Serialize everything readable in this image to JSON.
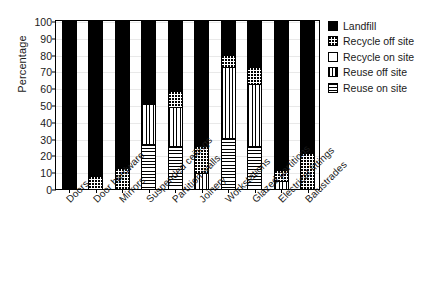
{
  "chart_data": {
    "type": "bar",
    "title": "",
    "subtitle": "",
    "xlabel": "",
    "ylabel": "Percentage",
    "ylim": [
      0,
      100
    ],
    "yticks": [
      0,
      10,
      20,
      30,
      40,
      50,
      60,
      70,
      80,
      90,
      100
    ],
    "grid": true,
    "stacked": true,
    "legend_position": "right",
    "categories": [
      "Doors",
      "Door hardware",
      "Mirrors",
      "Suspended ceilings",
      "Partition walls",
      "Joinery",
      "Workstations",
      "Glazed partitions",
      "Electrical fittings",
      "Balustrades"
    ],
    "series": [
      {
        "name": "Reuse on site",
        "pattern": "horizontal-lines",
        "color": "#ffffff",
        "values": [
          0,
          0,
          0,
          26,
          25,
          0,
          30,
          25,
          0,
          0
        ]
      },
      {
        "name": "Reuse off site",
        "pattern": "vertical-lines",
        "color": "#ffffff",
        "values": [
          0,
          0,
          0,
          24,
          23,
          9,
          42,
          37,
          4,
          0
        ]
      },
      {
        "name": "Recycle on site",
        "pattern": "solid-white",
        "color": "#ffffff",
        "values": [
          0,
          0,
          0,
          0,
          0,
          0,
          0,
          0,
          0,
          0
        ]
      },
      {
        "name": "Recycle off site",
        "pattern": "dots",
        "color": "#ffffff",
        "values": [
          0,
          7,
          12,
          0,
          10,
          16,
          7,
          10,
          7,
          21
        ]
      },
      {
        "name": "Landfill",
        "pattern": "solid-black",
        "color": "#000000",
        "values": [
          100,
          93,
          88,
          50,
          42,
          75,
          21,
          28,
          89,
          79
        ]
      }
    ]
  },
  "legend": {
    "items": [
      {
        "label": "Landfill",
        "swatch": "sw-landfill"
      },
      {
        "label": "Recycle off site",
        "swatch": "sw-recycle-off"
      },
      {
        "label": "Recycle on site",
        "swatch": "sw-recycle-on"
      },
      {
        "label": "Reuse off site",
        "swatch": "sw-reuse-off"
      },
      {
        "label": "Reuse on site",
        "swatch": "sw-reuse-on"
      }
    ]
  }
}
